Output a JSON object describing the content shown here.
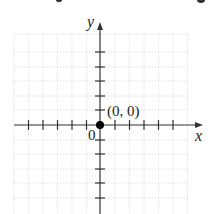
{
  "diagram": {
    "type": "coordinate-plane",
    "axes": {
      "x_label": "x",
      "y_label": "y",
      "origin_label": "0",
      "axis_color": "#333333",
      "grid_color": "#d8d8d8"
    },
    "point": {
      "label": "(0, 0)",
      "x": 0,
      "y": 0,
      "color": "#000000"
    },
    "grid": {
      "x_range": [
        -6,
        6
      ],
      "y_range": [
        -6,
        6
      ],
      "tick_spacing": 1
    }
  }
}
